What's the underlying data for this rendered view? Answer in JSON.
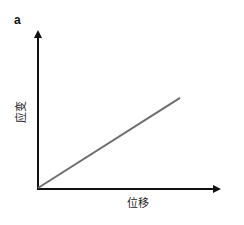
{
  "chart_data": {
    "type": "line",
    "panel_label": "a",
    "title": "",
    "xlabel": "位移",
    "ylabel": "应变",
    "x": [
      0,
      1
    ],
    "series": [
      {
        "name": "strain-displacement",
        "values": [
          0,
          0.63
        ],
        "color": "#6e6e6e"
      }
    ],
    "xlim": [
      0,
      1
    ],
    "ylim": [
      0,
      1
    ],
    "ticks": "none",
    "grid": false,
    "legend": "none",
    "axis_color": "#111111"
  }
}
